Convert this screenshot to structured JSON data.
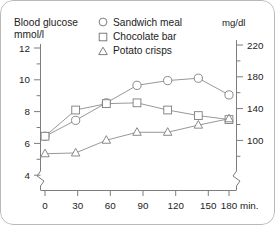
{
  "title": {
    "line1": "Blood glucose",
    "line2": "mmol/l"
  },
  "right_unit": "mg/dl",
  "legend": [
    {
      "marker": "circle-icon",
      "label": "Sandwich meal"
    },
    {
      "marker": "square-icon",
      "label": "Chocolate bar"
    },
    {
      "marker": "triangle-icon",
      "label": "Potato crisps"
    }
  ],
  "axis": {
    "left_ticks": [
      "12",
      "10",
      "8",
      "6",
      "4"
    ],
    "right_ticks": [
      "220",
      "180",
      "140",
      "100"
    ],
    "x_ticks": [
      "0",
      "30",
      "60",
      "90",
      "120",
      "150",
      "180"
    ],
    "x_unit": "min."
  },
  "chart_data": {
    "type": "line",
    "title": "Blood glucose mmol/l",
    "xlabel": "min.",
    "ylabel": "mmol/l",
    "y2label": "mg/dl",
    "x": [
      0,
      30,
      60,
      90,
      120,
      150,
      180
    ],
    "xlim": [
      0,
      180
    ],
    "ylim": [
      3.5,
      12.5
    ],
    "y2lim": [
      88,
      225
    ],
    "grid": false,
    "legend_position": "top-center",
    "axis_break": true,
    "series": [
      {
        "name": "Sandwich meal",
        "marker": "circle",
        "values": [
          6.45,
          7.45,
          8.55,
          9.65,
          9.95,
          10.1,
          9.05
        ]
      },
      {
        "name": "Chocolate bar",
        "marker": "square",
        "values": [
          6.45,
          8.1,
          8.5,
          8.55,
          8.1,
          7.75,
          7.5
        ]
      },
      {
        "name": "Potato crisps",
        "marker": "triangle",
        "values": [
          5.35,
          5.4,
          6.2,
          6.7,
          6.7,
          7.15,
          7.55
        ]
      }
    ]
  }
}
